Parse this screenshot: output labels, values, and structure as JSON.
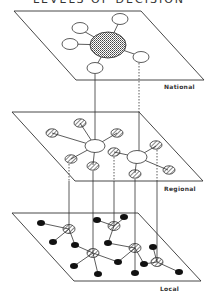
{
  "title": "LEVELS OF DECISION",
  "layers": [
    {
      "name": "National",
      "label": "National"
    },
    {
      "name": "Regional",
      "label": "Regional"
    },
    {
      "name": "Local",
      "label": "Local"
    }
  ],
  "legend": {
    "national_hub": "shaded (dotted) large node",
    "white_node": "open node",
    "hatched_node": "hatched node",
    "local_node": "solid black node"
  },
  "colors": {
    "line": "#333333",
    "fill_black": "#111111",
    "background": "#ffffff"
  }
}
